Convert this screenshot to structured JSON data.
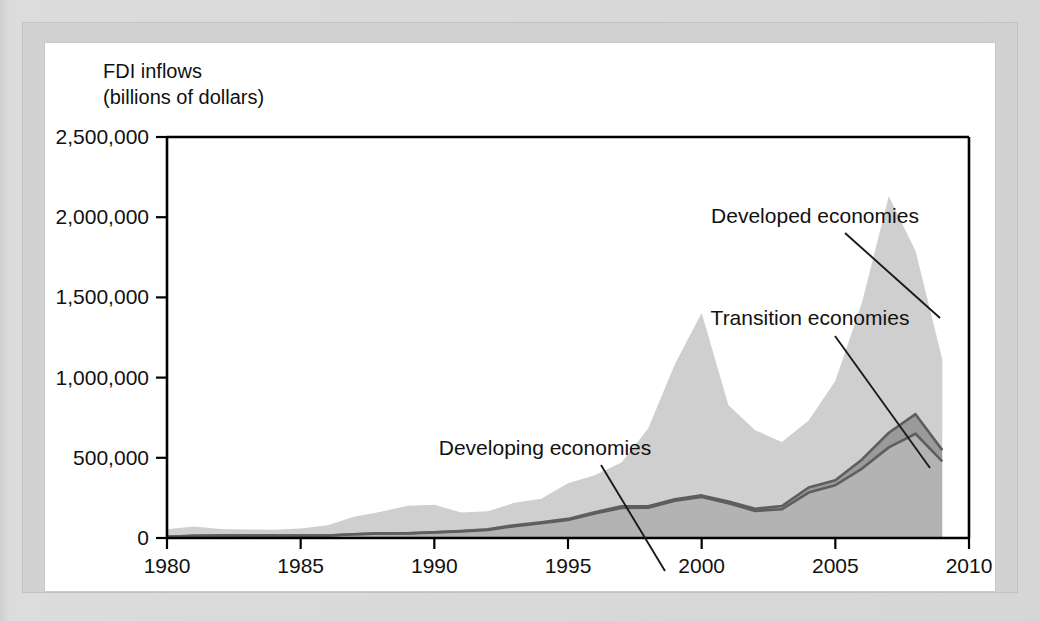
{
  "chart_data": {
    "type": "area",
    "stacked": true,
    "title": "",
    "ylabel": "FDI inflows (billions of dollars)",
    "ylabel_line1": "FDI inflows",
    "ylabel_line2": "(billions of dollars)",
    "xlabel": "",
    "xlim": [
      1980,
      2010
    ],
    "ylim": [
      0,
      2500000
    ],
    "grid": false,
    "legend_position": "annotations-on-plot",
    "yticks": [
      0,
      500000,
      1000000,
      1500000,
      2000000,
      2500000
    ],
    "ytick_labels": [
      "0",
      "500,000",
      "1,000,000",
      "1,500,000",
      "2,000,000",
      "2,500,000"
    ],
    "xticks": [
      1980,
      1985,
      1990,
      1995,
      2000,
      2005,
      2010
    ],
    "xtick_labels": [
      "1980",
      "1985",
      "1990",
      "1995",
      "2000",
      "2005",
      "2010"
    ],
    "x": [
      1980,
      1981,
      1982,
      1983,
      1984,
      1985,
      1986,
      1987,
      1988,
      1989,
      1990,
      1991,
      1992,
      1993,
      1994,
      1995,
      1996,
      1997,
      1998,
      1999,
      2000,
      2001,
      2002,
      2003,
      2004,
      2005,
      2006,
      2007,
      2008,
      2009
    ],
    "series": [
      {
        "name": "Developing economies",
        "color": "#b3b3b3",
        "values": [
          8000,
          14000,
          16000,
          15000,
          16000,
          15000,
          16000,
          23000,
          29000,
          29000,
          35000,
          41000,
          50000,
          74000,
          92000,
          113000,
          153000,
          187000,
          189000,
          232000,
          256000,
          217000,
          169000,
          179000,
          283000,
          329000,
          433000,
          565000,
          650000,
          478000
        ]
      },
      {
        "name": "Transition economies",
        "color": "#9a9a9a",
        "values": [
          0,
          0,
          0,
          0,
          0,
          0,
          0,
          0,
          0,
          300,
          700,
          2500,
          4200,
          6000,
          5900,
          6000,
          7500,
          11000,
          9000,
          9500,
          9500,
          11000,
          13000,
          20000,
          32000,
          31000,
          57000,
          91000,
          122000,
          70000
        ]
      },
      {
        "name": "Developed economies",
        "color": "#cfcfcf",
        "values": [
          46000,
          58000,
          40000,
          38000,
          36000,
          44000,
          64000,
          110000,
          134000,
          172000,
          172000,
          116000,
          112000,
          140000,
          147000,
          222000,
          230000,
          272000,
          484000,
          844000,
          1138000,
          601000,
          490000,
          400000,
          418000,
          619000,
          980000,
          1474000,
          1018000,
          566000
        ]
      }
    ],
    "totals": [
      54000,
      72000,
      56000,
      53000,
      52000,
      59000,
      80000,
      133000,
      163000,
      201000,
      208000,
      159000,
      166000,
      220000,
      245000,
      341000,
      390000,
      470000,
      682000,
      1085000,
      1403000,
      829000,
      672000,
      599000,
      733000,
      979000,
      1470000,
      2130000,
      1790000,
      1114000
    ],
    "annotations": [
      {
        "text": "Developed economies",
        "label_x": 770,
        "label_y": 180,
        "leader": [
          [
            800,
            190
          ],
          [
            895,
            275
          ]
        ]
      },
      {
        "text": "Transition economies",
        "label_x": 765,
        "label_y": 282,
        "leader": [
          [
            790,
            293
          ],
          [
            885,
            425
          ]
        ]
      },
      {
        "text": "Developing economies",
        "label_x": 500,
        "label_y": 412,
        "leader": [
          [
            556,
            422
          ],
          [
            620,
            528
          ]
        ]
      }
    ]
  }
}
